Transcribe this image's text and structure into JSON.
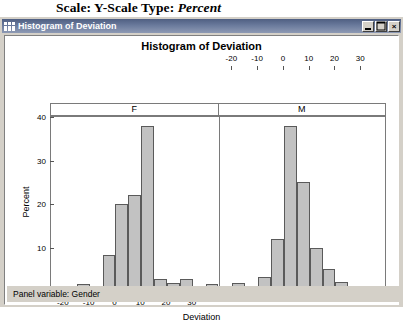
{
  "caption": {
    "prefix": "Scale: Y-Scale Type:",
    "emphasis": "Percent"
  },
  "window": {
    "title": "Histogram of Deviation",
    "icon": "histogram-window-icon",
    "buttons": {
      "minimize": "_",
      "maximize": "□",
      "close": "×"
    }
  },
  "footer": {
    "text": "Panel variable: Gender"
  },
  "chart_data": {
    "type": "bar",
    "title": "Histogram of Deviation",
    "xlabel": "Deviation",
    "ylabel": "Percent",
    "ylim": [
      0,
      40
    ],
    "yticks": [
      0,
      10,
      20,
      30,
      40
    ],
    "xlim": [
      -25,
      40
    ],
    "xticks": [
      -20,
      -10,
      0,
      10,
      20,
      30
    ],
    "grid": false,
    "panel_variable": "Gender",
    "bin_width": 5,
    "panels": [
      {
        "name": "F",
        "label": "F",
        "axis_position": "bottom",
        "bins": [
          -15,
          -5,
          0,
          5,
          10,
          15,
          20,
          25,
          35
        ],
        "values": [
          1.7,
          8.2,
          20.0,
          22.0,
          38.0,
          2.8,
          1.8,
          2.8,
          1.7
        ]
      },
      {
        "name": "M",
        "label": "M",
        "axis_position": "top",
        "bins": [
          -20,
          -10,
          -5,
          0,
          5,
          10,
          15,
          20
        ],
        "values": [
          1.8,
          3.2,
          12.0,
          38.0,
          25.0,
          10.0,
          5.0,
          2.0
        ]
      }
    ]
  },
  "colors": {
    "bar_fill": "#c2c2c2",
    "bar_border": "#5a5a5a",
    "frame": "#7a7a7a",
    "window_chrome": "#d4d0c8",
    "titlebar": "#4f5f82"
  }
}
